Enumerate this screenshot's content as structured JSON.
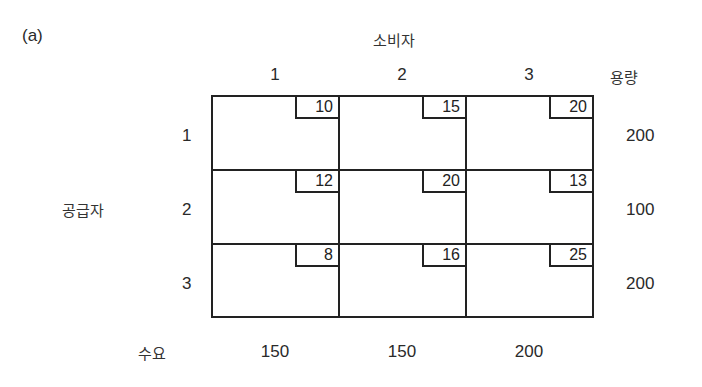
{
  "panel_label": "(a)",
  "consumer_title": "소비자",
  "supplier_title": "공급자",
  "capacity_title": "용량",
  "demand_title": "수요",
  "consumers": [
    "1",
    "2",
    "3"
  ],
  "suppliers": [
    "1",
    "2",
    "3"
  ],
  "costs": [
    [
      "10",
      "15",
      "20"
    ],
    [
      "12",
      "20",
      "13"
    ],
    [
      "8",
      "16",
      "25"
    ]
  ],
  "capacities": [
    "200",
    "100",
    "200"
  ],
  "demands": [
    "150",
    "150",
    "200"
  ]
}
